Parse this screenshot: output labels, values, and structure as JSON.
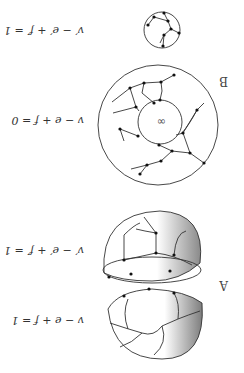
{
  "figure": {
    "orientation": "rotated 180 degrees",
    "panels": [
      {
        "label": "A",
        "parts": [
          {
            "name": "upper-hemisphere-cap",
            "equation": "v′ − e′ + f′ = 1"
          },
          {
            "name": "lower-hemisphere-cap",
            "equation": "v − e + f = 1"
          }
        ]
      },
      {
        "label": "B",
        "parts": [
          {
            "name": "annulus-graph",
            "equation": "v − e + f = 0",
            "center_symbol": "∞"
          },
          {
            "name": "disk-graph",
            "equation": "v′ − e′ + f′ = 1"
          }
        ]
      }
    ]
  },
  "colors": {
    "line": "#333333",
    "vertex": "#111111",
    "shade_dark": "#8a8a8a",
    "background": "#ffffff"
  }
}
